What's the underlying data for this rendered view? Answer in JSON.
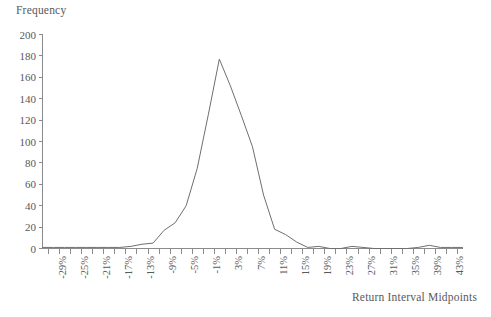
{
  "chart_data": {
    "type": "line",
    "title": "",
    "xlabel": "Return Interval Midpoints",
    "ylabel": "Frequency",
    "ylim": [
      0,
      200
    ],
    "ytick_values": [
      0,
      20,
      40,
      60,
      80,
      100,
      120,
      140,
      160,
      180,
      200
    ],
    "ytick_labels": [
      "0",
      "20",
      "40",
      "60",
      "80",
      "100",
      "120",
      "140",
      "160",
      "180",
      "200"
    ],
    "grid": false,
    "legend": "none",
    "xtick_step_percent": 2,
    "xlim_percent": [
      -31,
      45
    ],
    "xtick_labels_shown": [
      "-29%",
      "-25%",
      "-21%",
      "-17%",
      "-13%",
      "-9%",
      "-5%",
      "-1%",
      "3%",
      "7%",
      "11%",
      "15%",
      "19%",
      "23%",
      "27%",
      "31%",
      "35%",
      "39%",
      "43%"
    ],
    "x": [
      -29,
      -27,
      -25,
      -23,
      -21,
      -19,
      -17,
      -15,
      -13,
      -11,
      -9,
      -7,
      -5,
      -3,
      -1,
      1,
      3,
      5,
      7,
      9,
      11,
      13,
      15,
      17,
      19,
      21,
      23,
      25,
      27,
      29,
      31,
      33,
      35,
      37,
      39,
      41,
      43
    ],
    "categories": [
      "-29%",
      "-27%",
      "-25%",
      "-23%",
      "-21%",
      "-19%",
      "-17%",
      "-15%",
      "-13%",
      "-11%",
      "-9%",
      "-7%",
      "-5%",
      "-3%",
      "-1%",
      "1%",
      "3%",
      "5%",
      "7%",
      "9%",
      "11%",
      "13%",
      "15%",
      "17%",
      "19%",
      "21%",
      "23%",
      "25%",
      "27%",
      "29%",
      "31%",
      "33%",
      "35%",
      "37%",
      "39%",
      "41%",
      "43%"
    ],
    "values": [
      1,
      1,
      1,
      1,
      1,
      1,
      1,
      2,
      4,
      5,
      17,
      24,
      40,
      75,
      125,
      177,
      152,
      124,
      95,
      50,
      18,
      13,
      6,
      1,
      2,
      0,
      0,
      2,
      1,
      0,
      0,
      0,
      0,
      1,
      3,
      1,
      1
    ],
    "series": [
      {
        "name": "Frequency",
        "color": "#6e6f71",
        "values": [
          1,
          1,
          1,
          1,
          1,
          1,
          1,
          2,
          4,
          5,
          17,
          24,
          40,
          75,
          125,
          177,
          152,
          124,
          95,
          50,
          18,
          13,
          6,
          1,
          2,
          0,
          0,
          2,
          1,
          0,
          0,
          0,
          0,
          1,
          3,
          1,
          1
        ]
      }
    ],
    "peak": {
      "x": "1%",
      "value": 177
    }
  },
  "colors": {
    "axis": "#8a8b8d",
    "line": "#6e6f71",
    "text": "#58595b",
    "background": "#ffffff"
  }
}
